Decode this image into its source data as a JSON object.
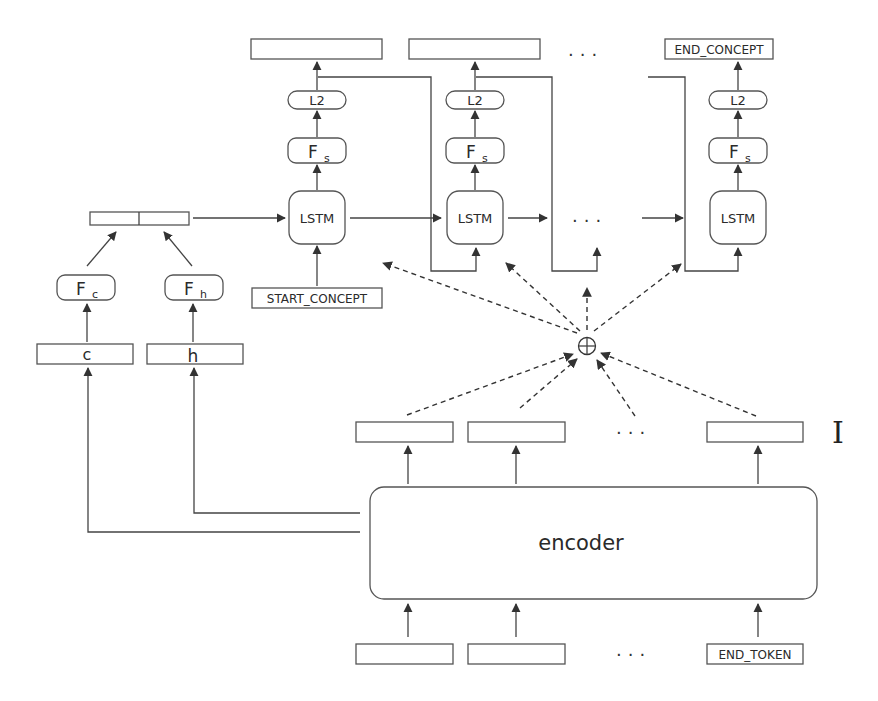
{
  "diagram": {
    "decoder": {
      "outputs": [
        "",
        "",
        "END_CONCEPT"
      ],
      "ellipsis": "...",
      "step_labels": {
        "loss": "L2",
        "projection": "F",
        "projection_sub": "s",
        "cell": "LSTM"
      },
      "start_token": "START_CONCEPT"
    },
    "init_state": {
      "c_label": "c",
      "h_label": "h",
      "fc_label": "F",
      "fc_sub": "c",
      "fh_label": "F",
      "fh_sub": "h"
    },
    "attention": {
      "combine_symbol": "⊕",
      "memory_label": "I"
    },
    "encoder": {
      "label": "encoder",
      "inputs": [
        "",
        "",
        "END_TOKEN"
      ],
      "ellipsis": "..."
    }
  }
}
